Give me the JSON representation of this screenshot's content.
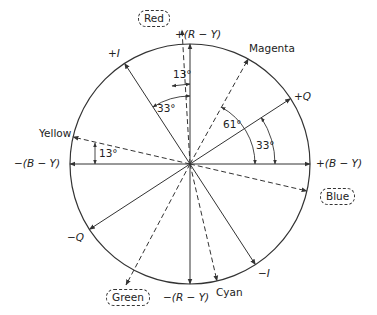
{
  "diagram": {
    "type": "color-phasor-diagram",
    "center": [
      190,
      164
    ],
    "radius": 120,
    "colors": {
      "stroke": "#333333",
      "background": "#ffffff"
    },
    "axes": [
      {
        "label": "+(R − Y)",
        "angle_deg": 90,
        "style": "solid"
      },
      {
        "label": "−(R − Y)",
        "angle_deg": 270,
        "style": "solid"
      },
      {
        "label": "+(B − Y)",
        "angle_deg": 0,
        "style": "solid"
      },
      {
        "label": "−(B − Y)",
        "angle_deg": 180,
        "style": "solid"
      },
      {
        "label": "+Q",
        "angle_deg": 33,
        "style": "solid"
      },
      {
        "label": "−Q",
        "angle_deg": 213,
        "style": "solid"
      },
      {
        "label": "+I",
        "angle_deg": 123,
        "style": "solid"
      },
      {
        "label": "−I",
        "angle_deg": 303,
        "style": "solid"
      }
    ],
    "color_vectors": [
      {
        "label": "Red",
        "angle_deg": 103,
        "style": "dashed",
        "boxed": true
      },
      {
        "label": "Magenta",
        "angle_deg": 61,
        "style": "dashed",
        "boxed": false
      },
      {
        "label": "Blue",
        "angle_deg": 347,
        "style": "dashed",
        "boxed": true
      },
      {
        "label": "Cyan",
        "angle_deg": 283,
        "style": "dashed",
        "boxed": false
      },
      {
        "label": "Green",
        "angle_deg": 241,
        "style": "dashed",
        "boxed": true
      },
      {
        "label": "Yellow",
        "angle_deg": 167,
        "style": "dashed",
        "boxed": false
      }
    ],
    "angle_annotations": [
      {
        "label": "13°",
        "between": [
          "+(R − Y)",
          "Red"
        ]
      },
      {
        "label": "33°",
        "between": [
          "+(R − Y)",
          "+I"
        ]
      },
      {
        "label": "61°",
        "between": [
          "+(B − Y)",
          "Magenta"
        ]
      },
      {
        "label": "33°",
        "between": [
          "+(B − Y)",
          "+Q"
        ]
      },
      {
        "label": "13°",
        "between": [
          "−(B − Y)",
          "Yellow"
        ]
      }
    ]
  },
  "labels": {
    "red": "Red",
    "r_minus_y_pos": "+(R − Y)",
    "magenta": "Magenta",
    "plus_i": "+I",
    "plus_q": "+Q",
    "yellow": "Yellow",
    "b_minus_y_neg": "−(B − Y)",
    "b_minus_y_pos": "+(B − Y)",
    "blue": "Blue",
    "minus_q": "−Q",
    "minus_i": "−I",
    "green": "Green",
    "r_minus_y_neg": "−(R − Y)",
    "cyan": "Cyan",
    "ang_13_top": "13°",
    "ang_33_top": "33°",
    "ang_61": "61°",
    "ang_33_right": "33°",
    "ang_13_left": "13°"
  }
}
